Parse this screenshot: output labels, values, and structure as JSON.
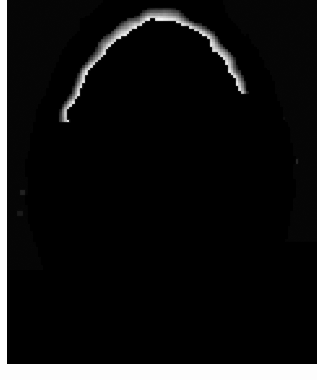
{
  "image": {
    "kind": "medical-brain-scan",
    "modality_appearance": "axial nuclear-medicine (PET/SPECT) grayscale slice",
    "orientation": "axial",
    "width": 317,
    "height": 380,
    "background_color": "#050505",
    "page_background_color": "#ffffff",
    "margin_left_px": 7,
    "margin_bottom_px": 16,
    "has_visible_text": false,
    "caption": "",
    "rendering": "pixelated / blocky low-resolution voxel texture"
  },
  "palette": {
    "background": "#050505",
    "scalp_halo": "#3c3c3c",
    "scalp_halo_bright": "#585858",
    "cortex_hot": "#ffffff",
    "cortex_bright": "#ededed",
    "parenchyma_light": "#c9c9c9",
    "parenchyma_mid": "#a8a8a8",
    "hypometabolic_patch": "#6f6f6f",
    "hypometabolic_deep": "#565656",
    "ventricle_dark": "#1a1a1a",
    "streak_artifact": "#2e2e2e"
  },
  "geometry": {
    "brain_center_x": 160,
    "brain_center_y": 168,
    "brain_radius_x": 105,
    "brain_radius_y": 152,
    "brain_top_y": 18,
    "brain_bottom_y": 320,
    "brain_left_x": 55,
    "brain_right_x": 265
  },
  "features": {
    "central_dark_focus": {
      "x": 162,
      "y": 103,
      "w": 16,
      "h": 11,
      "label": "third-ventricle-dark-focus"
    },
    "notes": [
      "bright white cortical ribbon around the periphery",
      "light gray interior parenchyma with scattered darker gray patches",
      "faint mid-gray scalp/skull halo outside the cortical ribbon",
      "vertical streak artifacts below the inferior brain margin"
    ]
  },
  "seed": 20240517
}
